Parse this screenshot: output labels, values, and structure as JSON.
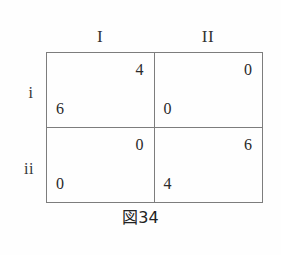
{
  "figure": {
    "caption": "図34",
    "border_color": "#7d7d7d",
    "background_color": "#fefefe",
    "text_color": "#2a2a2a"
  },
  "matrix": {
    "column_headers": [
      "I",
      "II"
    ],
    "row_headers": [
      "i",
      "ii"
    ],
    "cells": [
      [
        {
          "column_player_payoff": "4",
          "row_player_payoff": "6"
        },
        {
          "column_player_payoff": "0",
          "row_player_payoff": "0"
        }
      ],
      [
        {
          "column_player_payoff": "0",
          "row_player_payoff": "0"
        },
        {
          "column_player_payoff": "6",
          "row_player_payoff": "4"
        }
      ]
    ]
  }
}
